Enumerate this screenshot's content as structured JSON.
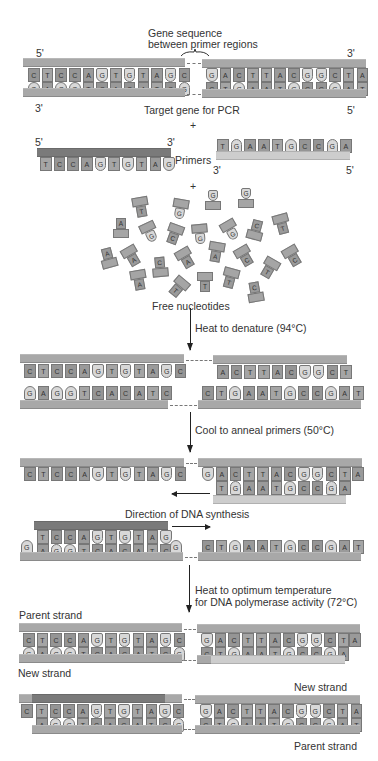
{
  "labels": {
    "gene_sequence": "Gene sequence",
    "between_primer": "between primer regions",
    "five_prime": "5'",
    "three_prime": "3'",
    "target_gene": "Target gene for PCR",
    "plus": "+",
    "primers": "Primers",
    "free_nucleotides": "Free nucleotides",
    "heat_denature": "Heat to denature (94°C)",
    "cool_anneal": "Cool to anneal primers (50°C)",
    "direction_synthesis": "Direction of DNA synthesis",
    "heat_optimum_1": "Heat to optimum temperature",
    "heat_optimum_2": "for DNA polymerase activity (72°C)",
    "parent_strand": "Parent strand",
    "new_strand": "New strand"
  },
  "sequences": {
    "left_top": [
      "C",
      "T",
      "C",
      "C",
      "A",
      "G",
      "T",
      "G",
      "T",
      "A",
      "G",
      "C"
    ],
    "left_bottom": [
      "G",
      "A",
      "G",
      "G",
      "T",
      "C",
      "A",
      "C",
      "A",
      "T",
      "C",
      "G"
    ],
    "right_top": [
      "G",
      "A",
      "C",
      "T",
      "T",
      "A",
      "C",
      "G",
      "G",
      "C",
      "T",
      "A"
    ],
    "right_bottom": [
      "C",
      "T",
      "G",
      "A",
      "A",
      "T",
      "G",
      "C",
      "C",
      "G",
      "A",
      "T"
    ],
    "primer_left": [
      "T",
      "C",
      "C",
      "A",
      "G",
      "T",
      "G",
      "T",
      "A",
      "G"
    ],
    "primer_right": [
      "T",
      "G",
      "A",
      "A",
      "T",
      "G",
      "C",
      "C",
      "G",
      "A"
    ],
    "denatured_left_top": [
      "C",
      "T",
      "C",
      "C",
      "A",
      "G",
      "T",
      "G",
      "T",
      "A",
      "G",
      "C"
    ],
    "denatured_right_top": [
      "A",
      "C",
      "T",
      "T",
      "A",
      "C",
      "G",
      "G",
      "C",
      "T"
    ],
    "denatured_left_bottom": [
      "G",
      "A",
      "G",
      "G",
      "T",
      "C",
      "A",
      "C",
      "A",
      "T",
      "C"
    ],
    "denatured_right_bottom": [
      "C",
      "T",
      "G",
      "A",
      "A",
      "T",
      "G",
      "C",
      "C",
      "G",
      "A",
      "T"
    ],
    "anneal_left_top": [
      "C",
      "T",
      "C",
      "C",
      "A",
      "G",
      "T",
      "G",
      "T",
      "A",
      "G",
      "C"
    ],
    "anneal_right_top_lead": "G",
    "anneal_right_pairs_top": [
      "A",
      "C",
      "T",
      "T",
      "A",
      "C",
      "G",
      "G",
      "C",
      "T"
    ],
    "anneal_right_pairs_bottom": [
      "T",
      "G",
      "A",
      "A",
      "T",
      "G",
      "C",
      "C",
      "G",
      "A"
    ],
    "anneal_right_tail": "A",
    "synth_pairs_top": [
      "T",
      "C",
      "C",
      "A",
      "G",
      "T",
      "G",
      "T",
      "A",
      "G"
    ],
    "synth_pairs_bottom": [
      "A",
      "G",
      "G",
      "T",
      "C",
      "A",
      "C",
      "A",
      "T",
      "C"
    ],
    "synth_left_lead": "G",
    "synth_left_tail": "G",
    "synth_right_bottom": [
      "C",
      "T",
      "G",
      "A",
      "A",
      "T",
      "G",
      "C",
      "C",
      "G",
      "A",
      "T"
    ],
    "final1_left_top": [
      "C",
      "T",
      "C",
      "C",
      "A",
      "G",
      "T",
      "G",
      "T",
      "A",
      "G",
      "C"
    ],
    "final1_left_bottom": [
      "G",
      "A",
      "G",
      "G",
      "T",
      "C",
      "A",
      "C",
      "A",
      "T",
      "C",
      "G"
    ],
    "final1_right_top": [
      "G",
      "A",
      "C",
      "T",
      "T",
      "A",
      "C",
      "G",
      "G",
      "C",
      "T"
    ],
    "final1_right_bottom": [
      "C",
      "T",
      "G",
      "A",
      "A",
      "T",
      "G",
      "C",
      "C",
      "G",
      "A"
    ],
    "final1_right_tail": "A",
    "final2_left_lead": "C",
    "final2_left_top": [
      "T",
      "C",
      "C",
      "A",
      "G",
      "T",
      "G",
      "T",
      "A",
      "G",
      "C"
    ],
    "final2_left_bottom": [
      "A",
      "G",
      "G",
      "T",
      "C",
      "A",
      "C",
      "A",
      "T",
      "C",
      "G"
    ],
    "final2_right_top": [
      "G",
      "A",
      "C",
      "T",
      "T",
      "A",
      "C",
      "G",
      "G",
      "C",
      "T",
      "A"
    ],
    "final2_right_bottom": [
      "C",
      "T",
      "G",
      "A",
      "A",
      "T",
      "G",
      "C",
      "C",
      "G",
      "A",
      "T"
    ]
  },
  "free_nucleotides": [
    {
      "x": 133,
      "y": 197,
      "r": -10,
      "b": "T"
    },
    {
      "x": 172,
      "y": 199,
      "r": 10,
      "b": "G",
      "g": true
    },
    {
      "x": 205,
      "y": 188,
      "r": 0,
      "b": "G",
      "g": true,
      "up": true
    },
    {
      "x": 238,
      "y": 186,
      "r": 0,
      "b": "G",
      "g": true,
      "up": true
    },
    {
      "x": 113,
      "y": 216,
      "r": 0,
      "b": "A",
      "up": true
    },
    {
      "x": 142,
      "y": 222,
      "r": -25,
      "b": "G",
      "g": true
    },
    {
      "x": 166,
      "y": 224,
      "r": 20,
      "b": "C"
    },
    {
      "x": 192,
      "y": 224,
      "r": -5,
      "b": "G",
      "g": true
    },
    {
      "x": 223,
      "y": 220,
      "r": -30,
      "b": "G",
      "g": true
    },
    {
      "x": 248,
      "y": 218,
      "r": 15,
      "b": "C",
      "up": true
    },
    {
      "x": 274,
      "y": 214,
      "r": -15,
      "b": "T"
    },
    {
      "x": 100,
      "y": 246,
      "r": -15,
      "b": "A",
      "up": true
    },
    {
      "x": 124,
      "y": 246,
      "r": -30,
      "b": "A"
    },
    {
      "x": 152,
      "y": 255,
      "r": -5,
      "b": "C",
      "up": true
    },
    {
      "x": 178,
      "y": 248,
      "r": -30,
      "b": "A"
    },
    {
      "x": 208,
      "y": 242,
      "r": 10,
      "b": "A"
    },
    {
      "x": 237,
      "y": 246,
      "r": -30,
      "b": "C"
    },
    {
      "x": 261,
      "y": 258,
      "r": 30,
      "b": "T"
    },
    {
      "x": 285,
      "y": 246,
      "r": -30,
      "b": "C"
    },
    {
      "x": 131,
      "y": 270,
      "r": -10,
      "b": "A"
    },
    {
      "x": 170,
      "y": 277,
      "r": 40,
      "b": "T"
    },
    {
      "x": 197,
      "y": 272,
      "r": 0,
      "b": "T"
    },
    {
      "x": 222,
      "y": 268,
      "r": 15,
      "b": "T"
    },
    {
      "x": 247,
      "y": 280,
      "r": -10,
      "b": "C",
      "up": true
    }
  ]
}
